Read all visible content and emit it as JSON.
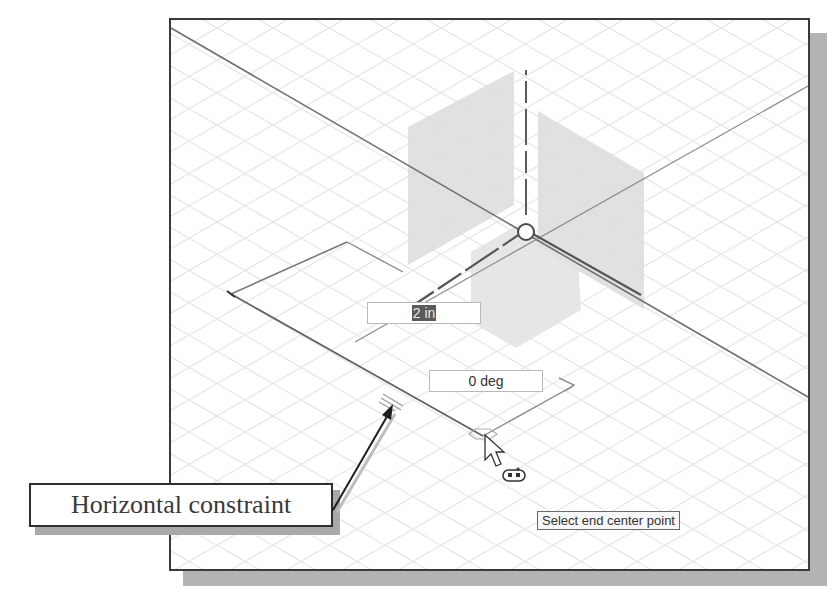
{
  "viewport": {
    "background": "#ffffff",
    "grid_color": "#d9d9d9",
    "axis_color": "#6b6b6b",
    "plane_fill": "#e0e0e0"
  },
  "dimension_inputs": {
    "length": {
      "value": "2 in",
      "selected": true
    },
    "angle": {
      "value": "0 deg"
    }
  },
  "tooltip": {
    "text": "Select end center point"
  },
  "callout": {
    "label": "Horizontal constraint",
    "points_to": "horizontal-constraint-glyph"
  },
  "icons": {
    "origin": "origin-circle-icon",
    "cursor": "mouse-pointer-icon",
    "cursor_badge": "slot-command-icon",
    "constraint": "horizontal-constraint-icon",
    "snap": "endpoint-snap-icon"
  }
}
